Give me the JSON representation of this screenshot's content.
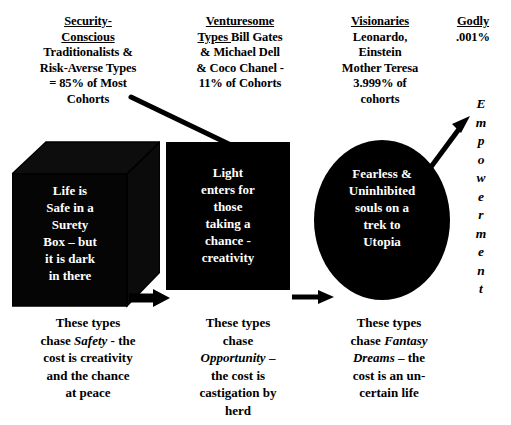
{
  "diagram": {
    "title_columns": [
      {
        "id": "security-conscious",
        "underlined": "Security-\nConscious",
        "rest": "Traditionalists &\nRisk-Averse Types\n= 85% of Most\nCohorts"
      },
      {
        "id": "venturesome",
        "underlined": "Venturesome\nTypes ",
        "rest": "Bill Gates\n& Michael Dell\n& Coco Chanel -\n11% of Cohorts"
      },
      {
        "id": "visionaries",
        "underlined": "Visionaries",
        "rest": "Leonardo,\nEinstein\nMother Teresa\n3.999% of\ncohorts"
      },
      {
        "id": "godly",
        "underlined": "Godly",
        "rest": ".001%"
      }
    ],
    "shapes": [
      {
        "id": "surety-box",
        "kind": "3d-box",
        "fill": "#000000",
        "text": "Life is\nSafe in a\nSurety\nBox – but\nit is dark\nin there"
      },
      {
        "id": "light-box",
        "kind": "rectangle",
        "fill": "#000000",
        "text": "Light\nenters for\nthose\ntaking a\nchance -\ncreativity"
      },
      {
        "id": "utopia-oval",
        "kind": "ellipse",
        "fill": "#000000",
        "text": "Fearless &\nUninhibited\nsouls on a\ntrek to\nUtopia"
      }
    ],
    "captions": [
      {
        "id": "safety-caption",
        "pre": "These types\nchase ",
        "em": "Safety",
        "post": " - the\ncost is creativity\nand the chance\nat peace"
      },
      {
        "id": "opportunity-caption",
        "pre": "These types\nchase\n",
        "em": "Opportunity",
        "post": " –\nthe cost is\ncastigation by\nherd"
      },
      {
        "id": "fantasy-caption",
        "pre": "These types\nchase ",
        "em": "Fantasy\nDreams",
        "post": " – the\ncost is an un-\ncertain life"
      }
    ],
    "empowerment": {
      "id": "empowerment-label",
      "letters": [
        "E",
        "m",
        "p",
        "o",
        "w",
        "e",
        "r",
        "m",
        "e",
        "n",
        "t"
      ]
    },
    "connectors": [
      {
        "id": "diagonal-line-security-to-light",
        "kind": "line"
      },
      {
        "id": "arrow-box-to-rect",
        "kind": "arrow-right"
      },
      {
        "id": "arrow-rect-to-oval",
        "kind": "arrow-right"
      },
      {
        "id": "arrow-oval-to-empowerment",
        "kind": "arrow-up-right"
      }
    ],
    "colors": {
      "shape_fill": "#000000",
      "shape_text": "#ffffff",
      "page_text": "#000000",
      "background": "#ffffff"
    }
  }
}
